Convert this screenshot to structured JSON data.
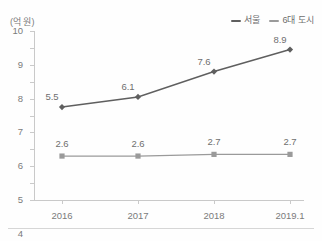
{
  "y_axis_unit": "(억 원)",
  "legend": {
    "items": [
      {
        "label": "서울",
        "color": "#5f5f5f",
        "marker": "diamond"
      },
      {
        "label": "6대 도시",
        "color": "#9a9a9a",
        "marker": "square"
      }
    ]
  },
  "colors": {
    "seoul": "#5f5f5f",
    "six_cities": "#9a9a9a",
    "axis": "#c9c9c9",
    "text": "#7b7b7b",
    "background": "#fefefe",
    "rule": "#d6d6d6"
  },
  "chart_data": {
    "type": "line",
    "title": "",
    "xlabel": "",
    "ylabel": "(억 원)",
    "categories": [
      "2016",
      "2017",
      "2018",
      "2019.1"
    ],
    "ylim": [
      0,
      10
    ],
    "yticks": [
      "0",
      "1",
      "2",
      "3",
      "4",
      "5",
      "6",
      "7",
      "8",
      "9",
      "10"
    ],
    "grid": false,
    "legend_position": "top-right",
    "series": [
      {
        "name": "서울",
        "color": "#5f5f5f",
        "marker": "diamond",
        "values": [
          5.5,
          6.1,
          7.6,
          8.9
        ],
        "labels": [
          "5.5",
          "6.1",
          "7.6",
          "8.9"
        ]
      },
      {
        "name": "6대 도시",
        "color": "#9a9a9a",
        "marker": "square",
        "values": [
          2.6,
          2.6,
          2.7,
          2.7
        ],
        "labels": [
          "2.6",
          "2.6",
          "2.7",
          "2.7"
        ]
      }
    ]
  }
}
